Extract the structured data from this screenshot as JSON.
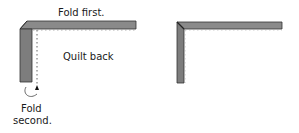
{
  "diagram": {
    "left": {
      "label_top": "Fold first.",
      "label_center": "Quilt back",
      "label_bottom_line1": "Fold",
      "label_bottom_line2": "second."
    },
    "right": {}
  },
  "colors": {
    "binding_fill": "#8a8a8a",
    "binding_edge": "#333333",
    "dotted_line": "#666666",
    "text": "#1a1a1a"
  }
}
